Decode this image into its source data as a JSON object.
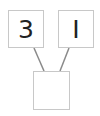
{
  "diagram": {
    "type": "tree",
    "nodes": [
      {
        "id": "left",
        "label": "3"
      },
      {
        "id": "right",
        "label": "I"
      },
      {
        "id": "bottom",
        "label": ""
      }
    ],
    "edges": [
      {
        "from": "left",
        "to": "bottom"
      },
      {
        "from": "right",
        "to": "bottom"
      }
    ],
    "colors": {
      "edge": "#8a8a8a",
      "border": "#c8c8c8",
      "text": "#222222"
    }
  }
}
